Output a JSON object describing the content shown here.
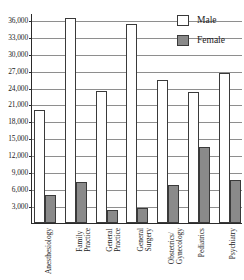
{
  "chart": {
    "title": "",
    "legend_position": "top-right",
    "grid": true
  },
  "legend": {
    "male_label": "Male",
    "female_label": "Female"
  },
  "axis": {
    "y_ticks": [
      "36,000",
      "33,000",
      "30,000",
      "27,000",
      "24,000",
      "21,000",
      "18,000",
      "15,000",
      "12,000",
      "9,000",
      "6,000",
      "3,000"
    ],
    "x_categories": [
      {
        "lines": [
          "Anesthesiology"
        ]
      },
      {
        "lines": [
          "Family",
          "Practice"
        ]
      },
      {
        "lines": [
          "General",
          "Practice"
        ]
      },
      {
        "lines": [
          "General",
          "Surgery"
        ]
      },
      {
        "lines": [
          "Obstetrics/",
          "Gynecology"
        ]
      },
      {
        "lines": [
          "Pediatrics"
        ]
      },
      {
        "lines": [
          "Psychiatry"
        ]
      }
    ]
  },
  "colors": {
    "male": "#ffffff",
    "female": "#8a8a8a",
    "outline": "#3a3a3a",
    "grid": "#8e8e8e",
    "axis": "#2a2a2a"
  },
  "chart_data": {
    "type": "bar",
    "title": "",
    "xlabel": "",
    "ylabel": "",
    "ylim": [
      0,
      37200
    ],
    "grid": true,
    "legend_position": "top-right",
    "categories": [
      "Anesthesiology",
      "Family Practice",
      "General Practice",
      "General Surgery",
      "Obstetrics/Gynecology",
      "Pediatrics",
      "Psychiatry"
    ],
    "yticks": [
      3000,
      6000,
      9000,
      12000,
      15000,
      18000,
      21000,
      24000,
      27000,
      30000,
      33000,
      36000
    ],
    "series": [
      {
        "name": "Male",
        "color": "#ffffff",
        "values": [
          20000,
          36300,
          23400,
          35300,
          25300,
          23200,
          26500
        ]
      },
      {
        "name": "Female",
        "color": "#8a8a8a",
        "values": [
          4900,
          7300,
          2300,
          2700,
          6800,
          13500,
          7600
        ]
      }
    ]
  }
}
